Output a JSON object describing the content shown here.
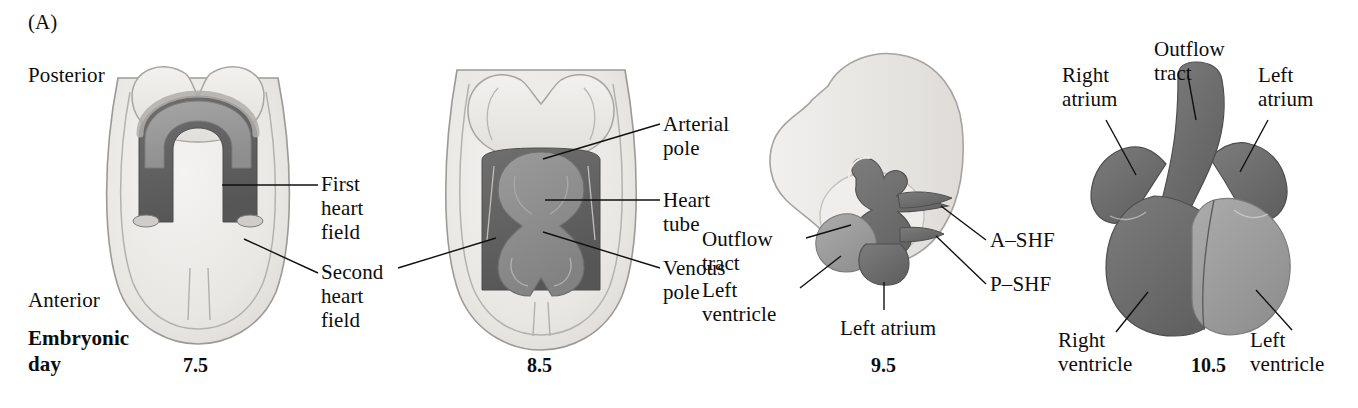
{
  "figure": {
    "panel_letter": "(A)",
    "row_label_line1": "Embryonic",
    "row_label_line2": "day",
    "orientation": {
      "posterior": "Posterior",
      "anterior": "Anterior"
    }
  },
  "palette": {
    "background": "#ffffff",
    "ink": "#0d0d0d",
    "embryo_outer": "#eceae7",
    "embryo_inner": "#e2e0dd",
    "neural_fold": "#e8e6e3",
    "first_heart_field": "#9a9a9a",
    "second_heart_field": "#5f5f5f",
    "heart_tube": "#8f8f8f",
    "dark_myocardium": "#6a6a6a",
    "light_myocardium": "#9e9e9e",
    "outline": "#8b8b8b"
  },
  "panels": [
    {
      "id": "day-7-5",
      "day": "7.5",
      "stage_name": "cardiac crescent",
      "labels": [
        {
          "id": "posterior",
          "text": "Posterior"
        },
        {
          "id": "anterior",
          "text": "Anterior"
        },
        {
          "id": "first-heart-field",
          "text": "First\nheart\nfield"
        },
        {
          "id": "second-heart-field",
          "text": "Second\nheart\nfield"
        }
      ]
    },
    {
      "id": "day-8-5",
      "day": "8.5",
      "stage_name": "linear heart tube",
      "labels": [
        {
          "id": "arterial-pole",
          "text": "Arterial\npole"
        },
        {
          "id": "heart-tube",
          "text": "Heart\ntube"
        },
        {
          "id": "venous-pole",
          "text": "Venous\npole"
        }
      ]
    },
    {
      "id": "day-9-5",
      "day": "9.5",
      "stage_name": "looped heart",
      "labels": [
        {
          "id": "outflow-tract",
          "text": "Outflow\ntract"
        },
        {
          "id": "left-ventricle",
          "text": "Left\nventricle"
        },
        {
          "id": "left-atrium",
          "text": "Left atrium"
        },
        {
          "id": "a-shf",
          "text": "A–SHF"
        },
        {
          "id": "p-shf",
          "text": "P–SHF"
        }
      ]
    },
    {
      "id": "day-10-5",
      "day": "10.5",
      "stage_name": "four-chambered heart",
      "labels": [
        {
          "id": "right-atrium",
          "text": "Right\natrium"
        },
        {
          "id": "outflow-tract",
          "text": "Outflow\ntract"
        },
        {
          "id": "left-atrium",
          "text": "Left\natrium"
        },
        {
          "id": "right-ventricle",
          "text": "Right\nventricle"
        },
        {
          "id": "left-ventricle",
          "text": "Left\nventricle"
        }
      ]
    }
  ]
}
